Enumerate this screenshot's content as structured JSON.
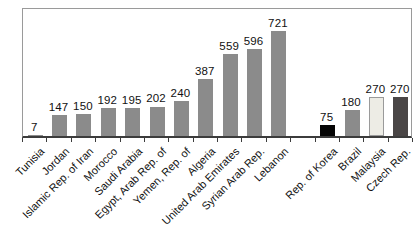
{
  "chart_data": {
    "type": "bar",
    "title": "",
    "xlabel": "",
    "ylabel": "",
    "ylim": [
      0,
      890
    ],
    "grid": false,
    "legend": "none",
    "group_break_after_index": 10,
    "default_bar_color": "#8b8b8b",
    "axis_color": "#3c3c3c",
    "frame_color": "#9a9a9a",
    "categories": [
      "Tunisia",
      "Jordan",
      "Islamic Rep. of Iran",
      "Morocco",
      "Saudi Arabia",
      "Egypt, Arab Rep. of",
      "Yemen, Rep. of",
      "Algeria",
      "United Arab Emirates",
      "Syrian Arab Rep.",
      "Lebanon",
      "Rep. of Korea",
      "Brazil",
      "Malaysia",
      "Czech Rep."
    ],
    "values": [
      7,
      147,
      150,
      192,
      195,
      202,
      240,
      387,
      559,
      596,
      721,
      75,
      180,
      270,
      270
    ],
    "bars": [
      {
        "label": "Tunisia",
        "value": 7,
        "color": "#8b8b8b",
        "border": ""
      },
      {
        "label": "Jordan",
        "value": 147,
        "color": "#8b8b8b",
        "border": ""
      },
      {
        "label": "Islamic Rep. of Iran",
        "value": 150,
        "color": "#8b8b8b",
        "border": ""
      },
      {
        "label": "Morocco",
        "value": 192,
        "color": "#8b8b8b",
        "border": ""
      },
      {
        "label": "Saudi Arabia",
        "value": 195,
        "color": "#8b8b8b",
        "border": ""
      },
      {
        "label": "Egypt, Arab Rep. of",
        "value": 202,
        "color": "#8b8b8b",
        "border": ""
      },
      {
        "label": "Yemen, Rep. of",
        "value": 240,
        "color": "#8b8b8b",
        "border": ""
      },
      {
        "label": "Algeria",
        "value": 387,
        "color": "#8b8b8b",
        "border": ""
      },
      {
        "label": "United Arab Emirates",
        "value": 559,
        "color": "#8b8b8b",
        "border": ""
      },
      {
        "label": "Syrian Arab Rep.",
        "value": 596,
        "color": "#8b8b8b",
        "border": ""
      },
      {
        "label": "Lebanon",
        "value": 721,
        "color": "#8b8b8b",
        "border": ""
      },
      {
        "label": "Rep. of Korea",
        "value": 75,
        "color": "#050505",
        "border": ""
      },
      {
        "label": "Brazil",
        "value": 180,
        "color": "#8b8b8b",
        "border": ""
      },
      {
        "label": "Malaysia",
        "value": 270,
        "color": "#edece5",
        "border": "#9a9a9a"
      },
      {
        "label": "Czech Rep.",
        "value": 270,
        "color": "#4a4646",
        "border": ""
      }
    ]
  }
}
